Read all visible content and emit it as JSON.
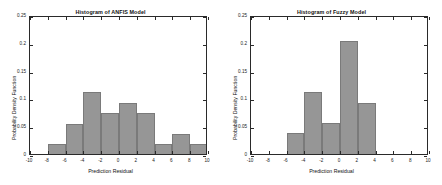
{
  "figure": {
    "background": "#ffffff",
    "bar_color": "#969696",
    "bar_edge_color": "#7a7a7a",
    "axis_color": "#2a2a2a"
  },
  "charts": [
    {
      "id": "anfis",
      "title": "Histogram of ANFIS Model",
      "xlabel": "Prediction Residual",
      "ylabel": "Probability Density Function",
      "xticks": [
        "-10",
        "-8",
        "-6",
        "-4",
        "-2",
        "0",
        "2",
        "4",
        "6",
        "8",
        "10"
      ],
      "yticks": [
        "0",
        "0.05",
        "0.1",
        "0.15",
        "0.2",
        "0.25"
      ]
    },
    {
      "id": "fuzzy",
      "title": "Histogram of Fuzzy Model",
      "xlabel": "Prediction Residual",
      "ylabel": "Probability Density Function",
      "xticks": [
        "-10",
        "-8",
        "-6",
        "-4",
        "-2",
        "0",
        "2",
        "4",
        "6",
        "8",
        "10"
      ],
      "yticks": [
        "0",
        "0.05",
        "0.1",
        "0.15",
        "0.2",
        "0.25"
      ]
    }
  ],
  "chart_data": [
    {
      "type": "bar",
      "title": "Histogram of ANFIS Model",
      "xlabel": "Prediction Residual",
      "ylabel": "Probability Density Function",
      "xlim": [
        -10,
        10
      ],
      "ylim": [
        0,
        0.25
      ],
      "xticks": [
        -10,
        -8,
        -6,
        -4,
        -2,
        0,
        2,
        4,
        6,
        8,
        10
      ],
      "yticks": [
        0,
        0.05,
        0.1,
        0.15,
        0.2,
        0.25
      ],
      "grid": false,
      "legend": null,
      "bin_width": 2,
      "bin_edges": [
        -8,
        -6,
        -4,
        -2,
        0,
        2,
        4,
        6,
        8,
        10
      ],
      "bin_centers": [
        -7,
        -5,
        -3,
        -1,
        1,
        3,
        5,
        7,
        9
      ],
      "values": [
        0.018,
        0.054,
        0.111,
        0.074,
        0.092,
        0.074,
        0.018,
        0.036,
        0.018
      ]
    },
    {
      "type": "bar",
      "title": "Histogram of Fuzzy Model",
      "xlabel": "Prediction Residual",
      "ylabel": "Probability Density Function",
      "xlim": [
        -10,
        10
      ],
      "ylim": [
        0,
        0.25
      ],
      "xticks": [
        -10,
        -8,
        -6,
        -4,
        -2,
        0,
        2,
        4,
        6,
        8,
        10
      ],
      "yticks": [
        0,
        0.05,
        0.1,
        0.15,
        0.2,
        0.25
      ],
      "grid": false,
      "legend": null,
      "bin_width": 2,
      "bin_edges": [
        -6,
        -4,
        -2,
        0,
        2,
        4
      ],
      "bin_centers": [
        -5,
        -3,
        -1,
        1,
        3
      ],
      "values": [
        0.037,
        0.111,
        0.055,
        0.203,
        0.092
      ]
    }
  ]
}
